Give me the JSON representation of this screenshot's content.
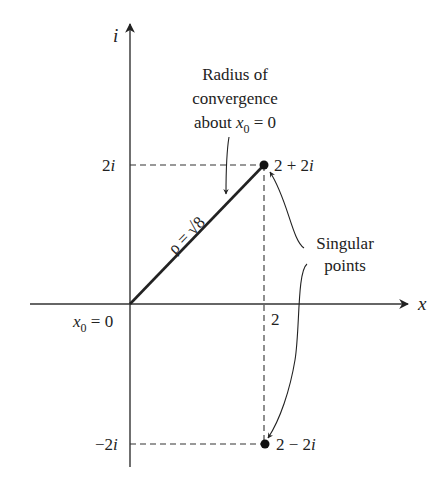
{
  "diagram": {
    "type": "complex-plane",
    "axes": {
      "real_label": "x",
      "imag_label": "i",
      "origin_label_var": "x",
      "origin_label_sub": "0",
      "origin_label_rest": " = 0",
      "x_tick": "2",
      "y_tick_pos": "2i",
      "y_tick_neg": "−2i"
    },
    "annotations": {
      "radius_line1": "Radius of",
      "radius_line2": "convergence",
      "radius_line3_pre": "about ",
      "radius_line3_var": "x",
      "radius_line3_sub": "0",
      "radius_line3_post": " = 0",
      "rho_label": "ρ = √8",
      "singular_line1": "Singular",
      "singular_line2": "points"
    },
    "points": [
      {
        "label": "2 + 2i",
        "re": 2,
        "im": 2
      },
      {
        "label": "2 − 2i",
        "re": 2,
        "im": -2
      }
    ],
    "radius": "√8",
    "colors": {
      "ink": "#222222",
      "background": "#ffffff"
    }
  }
}
